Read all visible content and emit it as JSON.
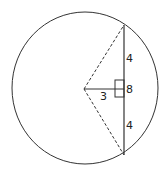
{
  "diagram": {
    "labels": {
      "half_chord_top": "4",
      "half_chord_bottom": "4",
      "chord_length": "8",
      "distance_center_to_chord": "3"
    },
    "colors": {
      "stroke": "#333333",
      "background": "#ffffff"
    }
  }
}
